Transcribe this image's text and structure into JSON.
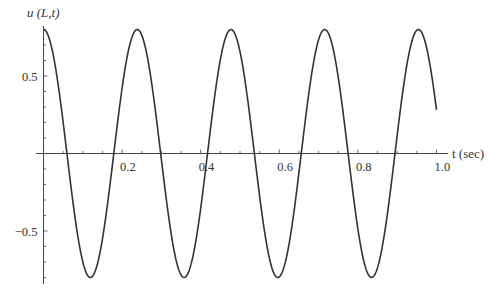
{
  "chart_data": {
    "type": "line",
    "title": "",
    "xlabel": "t (sec)",
    "ylabel": "u (L,t)",
    "xlim": [
      0,
      1.0
    ],
    "ylim": [
      -0.8,
      0.8
    ],
    "x_ticks": [
      0.2,
      0.4,
      0.6,
      0.8,
      1.0
    ],
    "x_tick_labels": [
      "0.2",
      "0.4",
      "0.6",
      "0.8",
      "1.0"
    ],
    "y_ticks": [
      0.5,
      -0.5
    ],
    "y_tick_labels": [
      "0.5",
      "−0.5"
    ],
    "grid": false,
    "legend": null,
    "series": [
      {
        "name": "u(L,t)",
        "function": "0.8*cos(2*pi*t/0.2385)",
        "amplitude": 0.8,
        "period": 0.2385,
        "x": [
          0,
          0.06,
          0.119,
          0.179,
          0.2385,
          0.298,
          0.358,
          0.417,
          0.477,
          0.537,
          0.596,
          0.656,
          0.716,
          0.775,
          0.835,
          0.894,
          0.954,
          1.0
        ],
        "values": [
          0.8,
          0.0,
          -0.8,
          0.0,
          0.8,
          0.0,
          -0.8,
          0.0,
          0.8,
          0.0,
          -0.8,
          0.0,
          0.8,
          0.0,
          -0.8,
          0.0,
          0.8,
          0.24
        ]
      }
    ],
    "color": "#333333"
  }
}
